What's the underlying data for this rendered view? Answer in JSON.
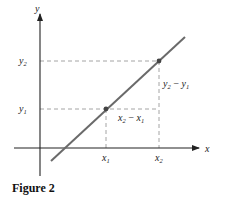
{
  "figure": {
    "caption": "Figure 2",
    "axes": {
      "x_label": "x",
      "y_label": "y"
    },
    "points": [
      {
        "name": "P1",
        "x_label": "x",
        "x_sub": "1",
        "y_label": "y",
        "y_sub": "1"
      },
      {
        "name": "P2",
        "x_label": "x",
        "x_sub": "2",
        "y_label": "y",
        "y_sub": "2"
      }
    ],
    "annotations": {
      "run": {
        "a": "x",
        "a_sub": "2",
        "op": "−",
        "b": "x",
        "b_sub": "1"
      },
      "rise": {
        "a": "y",
        "a_sub": "2",
        "op": "−",
        "b": "y",
        "b_sub": "1"
      }
    },
    "colors": {
      "line": "#6a6a6a",
      "axes": "#222222",
      "dashed": "#9a9a9a",
      "point": "#444444"
    }
  }
}
